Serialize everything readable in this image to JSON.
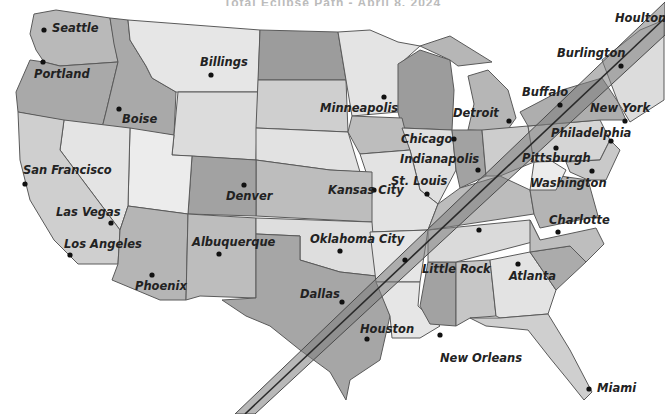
{
  "title": "Total Eclipse Path - April 8, 2024",
  "colors": {
    "background": "#ffffff",
    "state_light": "#e8e8e8",
    "state_mid": "#cfcfcf",
    "state_dark": "#a9a9a9",
    "state_darker": "#959595",
    "border": "#5a5a5a",
    "path_band": "#8c8c8c",
    "path_centerline": "#2a2a2a",
    "text": "#222222"
  },
  "eclipse_path": {
    "label": "Path of totality",
    "from_city": "Dallas",
    "to_city": "Houlton"
  },
  "cities": [
    {
      "name": "Seattle",
      "x": 44,
      "y": 30,
      "lx": 54,
      "ly": 31
    },
    {
      "name": "Portland",
      "x": 43,
      "y": 62,
      "lx": 35,
      "ly": 78
    },
    {
      "name": "Boise",
      "x": 119,
      "y": 109,
      "lx": 122,
      "ly": 122
    },
    {
      "name": "Billings",
      "x": 211,
      "y": 75,
      "lx": 200,
      "ly": 67
    },
    {
      "name": "Minneapolis",
      "x": 384,
      "y": 97,
      "lx": 320,
      "ly": 111
    },
    {
      "name": "Chicago",
      "x": 454,
      "y": 139,
      "lx": 400,
      "ly": 143
    },
    {
      "name": "Detroit",
      "x": 509,
      "y": 121,
      "lx": 453,
      "ly": 116
    },
    {
      "name": "Buffalo",
      "x": 561,
      "y": 104,
      "lx": 520,
      "ly": 95
    },
    {
      "name": "Burlington",
      "x": 621,
      "y": 66,
      "lx": 556,
      "ly": 56
    },
    {
      "name": "Houlton",
      "x": 0,
      "y": 0,
      "lx": 616,
      "ly": 22
    },
    {
      "name": "New York",
      "x": 625,
      "y": 121,
      "lx": 590,
      "ly": 111
    },
    {
      "name": "Philadelphia",
      "x": 611,
      "y": 140,
      "lx": 552,
      "ly": 137
    },
    {
      "name": "Pittsburgh",
      "x": 556,
      "y": 148,
      "lx": 522,
      "ly": 162
    },
    {
      "name": "Washington",
      "x": 592,
      "y": 170,
      "lx": 530,
      "ly": 186
    },
    {
      "name": "Indianapolis",
      "x": 477,
      "y": 170,
      "lx": 400,
      "ly": 163
    },
    {
      "name": "St. Louis",
      "x": 427,
      "y": 194,
      "lx": 391,
      "ly": 182
    },
    {
      "name": "Kansas City",
      "x": 374,
      "y": 189,
      "lx": 330,
      "ly": 194
    },
    {
      "name": "Denver",
      "x": 244,
      "y": 185,
      "lx": 226,
      "ly": 200
    },
    {
      "name": "San Francisco",
      "x": 25,
      "y": 184,
      "lx": 24,
      "ly": 174
    },
    {
      "name": "Las Vegas",
      "x": 111,
      "y": 223,
      "lx": 56,
      "ly": 216
    },
    {
      "name": "Los Angeles",
      "x": 70,
      "y": 255,
      "lx": 64,
      "ly": 248
    },
    {
      "name": "Albuquerque",
      "x": 219,
      "y": 254,
      "lx": 193,
      "ly": 246
    },
    {
      "name": "Phoenix",
      "x": 152,
      "y": 275,
      "lx": 136,
      "ly": 290
    },
    {
      "name": "Oklahoma City",
      "x": 339,
      "y": 251,
      "lx": 310,
      "ly": 243
    },
    {
      "name": "Little Rock",
      "x": 405,
      "y": 260,
      "lx": 423,
      "ly": 273
    },
    {
      "name": "Charlotte",
      "x": 558,
      "y": 232,
      "lx": 549,
      "ly": 224
    },
    {
      "name": "Atlanta",
      "x": 518,
      "y": 264,
      "lx": 510,
      "ly": 280
    },
    {
      "name": "Dallas",
      "x": 342,
      "y": 302,
      "lx": 300,
      "ly": 298
    },
    {
      "name": "Houston",
      "x": 367,
      "y": 339,
      "lx": 360,
      "ly": 333
    },
    {
      "name": "New Orleans",
      "x": 440,
      "y": 335,
      "lx": 440,
      "ly": 362
    },
    {
      "name": "Miami",
      "x": 589,
      "y": 389,
      "lx": 597,
      "ly": 391
    },
    {
      "name": "Nashville (unlabeled)",
      "x": 479,
      "y": 230,
      "lx": null,
      "ly": null
    }
  ]
}
